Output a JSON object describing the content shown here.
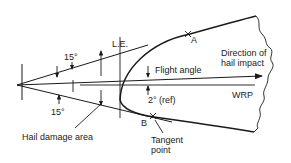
{
  "diagram": {
    "colors": {
      "ink": "#1a1a1a",
      "background": "#ffffff"
    },
    "labels": {
      "upper_angle": "15°",
      "lower_angle": "15°",
      "leading_edge": "L.E.",
      "point_a": "A",
      "point_b": "B",
      "direction_line1": "Direction of",
      "direction_line2": "hail impact",
      "flight_angle": "Flight angle",
      "ref_angle": "2° (ref)",
      "wrp": "WRP",
      "hail_damage_area": "Hail damage area",
      "tangent_line1": "Tangent",
      "tangent_line2": "point"
    }
  }
}
